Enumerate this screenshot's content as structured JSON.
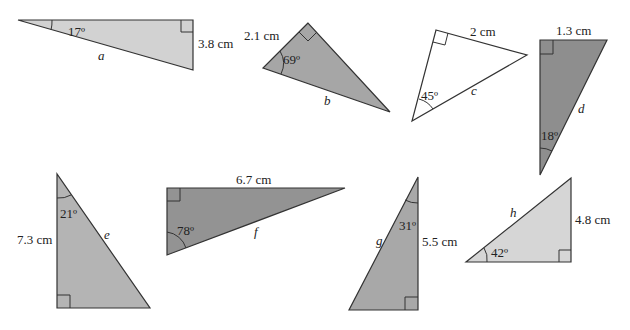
{
  "triangles": [
    {
      "id": "a",
      "fill": "#d2d2d2",
      "points": [
        [
          18,
          20
        ],
        [
          193,
          20
        ],
        [
          193,
          70
        ]
      ],
      "right_angle": [
        [
          181,
          20
        ],
        [
          181,
          32
        ],
        [
          193,
          32
        ]
      ],
      "arc": "M 52 20 A 34 34 0 0 1 51 30",
      "labels": {
        "angle": {
          "text": "17º",
          "x": 68,
          "y": 36
        },
        "side": {
          "text": "3.8 cm",
          "x": 198,
          "y": 48
        },
        "variable": {
          "text": "a",
          "x": 98,
          "y": 60
        }
      }
    },
    {
      "id": "b",
      "fill": "#a6a6a6",
      "points": [
        [
          308,
          23
        ],
        [
          263,
          68
        ],
        [
          390,
          112
        ]
      ],
      "right_angle": [
        [
          299,
          32
        ],
        [
          308,
          41
        ],
        [
          317,
          32
        ]
      ],
      "arc": "M 280 51 A 24 24 0 0 1 281 74",
      "labels": {
        "angle": {
          "text": "69º",
          "x": 283,
          "y": 64
        },
        "side": {
          "text": "2.1 cm",
          "x": 244,
          "y": 40
        },
        "variable": {
          "text": "b",
          "x": 324,
          "y": 105
        }
      }
    },
    {
      "id": "c",
      "fill": "#ffffff",
      "points": [
        [
          436,
          30
        ],
        [
          527,
          55
        ],
        [
          412,
          121
        ]
      ],
      "right_angle": [
        [
          448,
          33
        ],
        [
          445,
          45
        ],
        [
          433,
          42
        ]
      ],
      "arc": "M 419 99 A 24 24 0 0 1 433 109",
      "labels": {
        "angle": {
          "text": "45º",
          "x": 421,
          "y": 100
        },
        "side": {
          "text": "2 cm",
          "x": 470,
          "y": 36
        },
        "variable": {
          "text": "c",
          "x": 471,
          "y": 95
        }
      }
    },
    {
      "id": "d",
      "fill": "#8e8e8e",
      "points": [
        [
          540,
          40
        ],
        [
          607,
          40
        ],
        [
          540,
          175
        ]
      ],
      "right_angle": [
        [
          540,
          54
        ],
        [
          553,
          54
        ],
        [
          553,
          40
        ]
      ],
      "arc": "M 540 148 A 27 27 0 0 1 552 151",
      "labels": {
        "angle": {
          "text": "18º",
          "x": 541,
          "y": 140
        },
        "side": {
          "text": "1.3 cm",
          "x": 556,
          "y": 35
        },
        "variable": {
          "text": "d",
          "x": 578,
          "y": 113
        }
      }
    },
    {
      "id": "e",
      "fill": "#b4b4b4",
      "points": [
        [
          57,
          174
        ],
        [
          57,
          308
        ],
        [
          150,
          308
        ]
      ],
      "right_angle": [
        [
          57,
          295
        ],
        [
          70,
          295
        ],
        [
          70,
          308
        ]
      ],
      "arc": "M 57 198 A 24 24 0 0 0 71 195",
      "labels": {
        "angle": {
          "text": "21º",
          "x": 60,
          "y": 218
        },
        "side": {
          "text": "7.3 cm",
          "x": 17,
          "y": 244
        },
        "variable": {
          "text": "e",
          "x": 104,
          "y": 239
        }
      }
    },
    {
      "id": "f",
      "fill": "#939393",
      "points": [
        [
          167,
          188
        ],
        [
          345,
          188
        ],
        [
          167,
          255
        ]
      ],
      "right_angle": [
        [
          167,
          201
        ],
        [
          180,
          201
        ],
        [
          180,
          188
        ]
      ],
      "arc": "M 167 232 A 23 23 0 0 1 186 248",
      "labels": {
        "angle": {
          "text": "78º",
          "x": 177,
          "y": 235
        },
        "side": {
          "text": "6.7 cm",
          "x": 236,
          "y": 184
        },
        "variable": {
          "text": "f",
          "x": 254,
          "y": 236
        }
      }
    },
    {
      "id": "g",
      "fill": "#a8a8a8",
      "points": [
        [
          418,
          177
        ],
        [
          418,
          310
        ],
        [
          349,
          310
        ]
      ],
      "right_angle": [
        [
          405,
          310
        ],
        [
          405,
          297
        ],
        [
          418,
          297
        ]
      ],
      "arc": "M 405 200 A 26 26 0 0 0 418 203",
      "labels": {
        "angle": {
          "text": "31º",
          "x": 399,
          "y": 230
        },
        "side": {
          "text": "5.5 cm",
          "x": 422,
          "y": 246
        },
        "variable": {
          "text": "g",
          "x": 376,
          "y": 245
        }
      }
    },
    {
      "id": "h",
      "fill": "#d6d6d6",
      "points": [
        [
          571,
          178
        ],
        [
          571,
          262
        ],
        [
          466,
          262
        ]
      ],
      "right_angle": [
        [
          559,
          262
        ],
        [
          559,
          250
        ],
        [
          571,
          250
        ]
      ],
      "arc": "M 487 262 A 21 21 0 0 0 484 248",
      "labels": {
        "angle": {
          "text": "42º",
          "x": 491,
          "y": 257
        },
        "side": {
          "text": "4.8 cm",
          "x": 575,
          "y": 224
        },
        "variable": {
          "text": "h",
          "x": 510,
          "y": 217
        }
      }
    }
  ]
}
